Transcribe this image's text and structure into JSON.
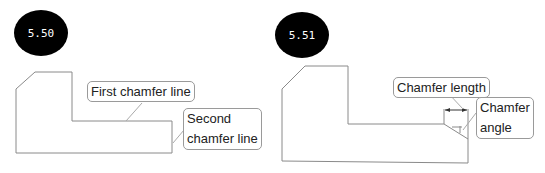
{
  "figures": [
    {
      "id_label": "5.50",
      "callouts": [
        {
          "text": "First chamfer line"
        },
        {
          "text_line1": "Second",
          "text_line2": "chamfer line"
        }
      ]
    },
    {
      "id_label": "5.51",
      "callouts": [
        {
          "text": "Chamfer length"
        },
        {
          "text_line1": "Chamfer",
          "text_line2": "angle"
        }
      ]
    }
  ],
  "colors": {
    "outline": "#8a8a8a",
    "badge": "#000000",
    "badge_text": "#ffffff"
  }
}
